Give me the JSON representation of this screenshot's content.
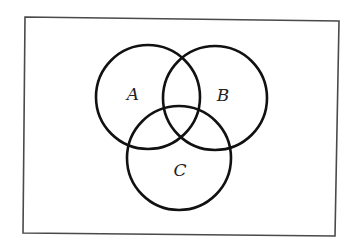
{
  "diagram": {
    "type": "venn",
    "universe": {
      "corners": [
        [
          25,
          17
        ],
        [
          339,
          21
        ],
        [
          335,
          236
        ],
        [
          23,
          233
        ]
      ],
      "stroke_color": "#4a4a4a"
    },
    "sets": [
      {
        "label": "A",
        "cx": 148,
        "cy": 97,
        "r": 52,
        "label_x": 133,
        "label_y": 94
      },
      {
        "label": "B",
        "cx": 215,
        "cy": 98,
        "r": 52,
        "label_x": 223,
        "label_y": 95
      },
      {
        "label": "C",
        "cx": 179,
        "cy": 158,
        "r": 52,
        "label_x": 180,
        "label_y": 170
      }
    ],
    "stroke_color": "#111111"
  }
}
